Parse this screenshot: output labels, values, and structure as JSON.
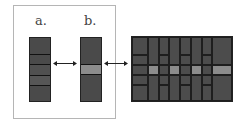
{
  "labels": {
    "a": "a.",
    "b": "b."
  },
  "colors": {
    "bar": "#4a4a4a",
    "highlight": "#8c8c8c",
    "divider": "#111111",
    "frame": "#b5b5b5"
  },
  "bar_a": {
    "segments": 5,
    "highlight_index": null
  },
  "bar_b": {
    "segments": 3,
    "highlight_index": 1
  },
  "arrows": [
    {
      "from": "bar-a",
      "to": "bar-b",
      "type": "double"
    },
    {
      "from": "bar-b",
      "to": "grid",
      "type": "double"
    }
  ],
  "grid": {
    "columns": 8,
    "highlight_row": "middle",
    "highlighted_columns": [
      2,
      4,
      6,
      8
    ]
  }
}
